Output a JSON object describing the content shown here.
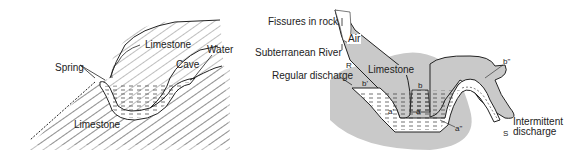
{
  "left_diagram": {
    "labels": {
      "limestone_top": "Limestone",
      "water": "Water",
      "cave": "Cave",
      "spring": "Spring",
      "limestone_bottom": "Limestone"
    }
  },
  "right_diagram": {
    "labels": {
      "fissures": "Fissures in rock",
      "air": "Air",
      "subterranean_river": "Subterranean River",
      "r": "R",
      "regular_discharge": "Regular discharge",
      "b_prime": "b'",
      "limestone": "Limestone",
      "b": "b",
      "b_double": "b\"",
      "a_prime": "a'",
      "a": "a",
      "a_double": "a\"",
      "intermittent": "Intermittent",
      "discharge": "discharge",
      "s": "S"
    }
  },
  "colors": {
    "rock_gray": "#c9c9c9",
    "line": "#222222",
    "water_fill": "#ffffff"
  }
}
